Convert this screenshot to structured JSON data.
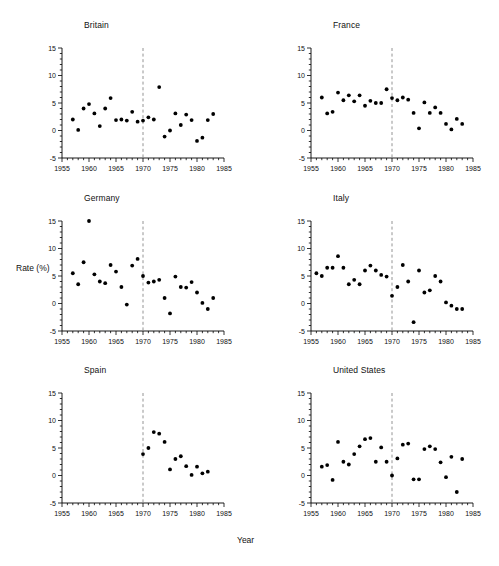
{
  "figure": {
    "xlabel": "Year",
    "ylabel": "Rate (%)"
  },
  "chart_data": [
    {
      "type": "scatter",
      "title": "Britain",
      "xlabel": "Year",
      "ylabel": "Rate (%)",
      "xlim": [
        1955,
        1985
      ],
      "ylim": [
        -5,
        15
      ],
      "xticks": [
        1955,
        1960,
        1965,
        1970,
        1975,
        1980,
        1985
      ],
      "yticks": [
        -5,
        0,
        5,
        10,
        15
      ],
      "grid": false,
      "reference_line_x": 1970,
      "reference_line_style": "dashed",
      "x": [
        1957,
        1958,
        1959,
        1960,
        1961,
        1962,
        1963,
        1964,
        1965,
        1966,
        1967,
        1968,
        1969,
        1970,
        1971,
        1972,
        1973,
        1974,
        1975,
        1976,
        1977,
        1978,
        1979,
        1980,
        1981,
        1982,
        1983
      ],
      "y": [
        2.0,
        0.1,
        4.0,
        4.8,
        3.1,
        0.8,
        4.0,
        5.9,
        1.9,
        2.0,
        1.8,
        3.4,
        1.6,
        1.8,
        2.4,
        2.0,
        7.9,
        -1.1,
        0.0,
        3.1,
        1.0,
        2.9,
        1.9,
        -1.9,
        -1.3,
        1.9,
        3.0
      ]
    },
    {
      "type": "scatter",
      "title": "France",
      "xlabel": "Year",
      "ylabel": "Rate (%)",
      "xlim": [
        1955,
        1985
      ],
      "ylim": [
        -5,
        15
      ],
      "xticks": [
        1955,
        1960,
        1965,
        1970,
        1975,
        1980,
        1985
      ],
      "yticks": [
        -5,
        0,
        5,
        10,
        15
      ],
      "grid": false,
      "reference_line_x": 1970,
      "reference_line_style": "dashed",
      "x": [
        1957,
        1958,
        1959,
        1960,
        1961,
        1962,
        1963,
        1964,
        1965,
        1966,
        1967,
        1968,
        1969,
        1970,
        1971,
        1972,
        1973,
        1974,
        1975,
        1976,
        1977,
        1978,
        1979,
        1980,
        1981,
        1982,
        1983
      ],
      "y": [
        6.0,
        3.1,
        3.4,
        6.9,
        5.5,
        6.4,
        5.3,
        6.4,
        4.5,
        5.4,
        5.0,
        5.0,
        7.5,
        5.9,
        5.5,
        6.0,
        5.6,
        3.2,
        0.4,
        5.1,
        3.2,
        4.2,
        3.2,
        1.2,
        0.2,
        2.1,
        1.2
      ]
    },
    {
      "type": "scatter",
      "title": "Germany",
      "xlabel": "Year",
      "ylabel": "Rate (%)",
      "xlim": [
        1955,
        1985
      ],
      "ylim": [
        -5,
        15
      ],
      "xticks": [
        1955,
        1960,
        1965,
        1970,
        1975,
        1980,
        1985
      ],
      "yticks": [
        -5,
        0,
        5,
        10,
        15
      ],
      "grid": false,
      "reference_line_x": 1970,
      "reference_line_style": "dashed",
      "x": [
        1957,
        1958,
        1959,
        1960,
        1961,
        1962,
        1963,
        1964,
        1965,
        1966,
        1967,
        1968,
        1969,
        1970,
        1971,
        1972,
        1973,
        1974,
        1975,
        1976,
        1977,
        1978,
        1979,
        1980,
        1981,
        1982,
        1983
      ],
      "y": [
        5.5,
        3.5,
        7.5,
        15.0,
        5.3,
        4.0,
        3.7,
        7.0,
        5.8,
        3.0,
        -0.2,
        6.9,
        8.1,
        5.0,
        3.8,
        4.0,
        4.3,
        1.0,
        -1.8,
        4.9,
        3.0,
        2.9,
        3.9,
        2.0,
        0.1,
        -1.0,
        1.0
      ]
    },
    {
      "type": "scatter",
      "title": "Italy",
      "xlabel": "Year",
      "ylabel": "Rate (%)",
      "xlim": [
        1955,
        1985
      ],
      "ylim": [
        -5,
        15
      ],
      "xticks": [
        1955,
        1960,
        1965,
        1970,
        1975,
        1980,
        1985
      ],
      "yticks": [
        -5,
        0,
        5,
        10,
        15
      ],
      "grid": false,
      "reference_line_x": 1970,
      "reference_line_style": "dashed",
      "x": [
        1956,
        1957,
        1958,
        1959,
        1960,
        1961,
        1962,
        1963,
        1964,
        1965,
        1966,
        1967,
        1968,
        1969,
        1970,
        1971,
        1972,
        1973,
        1974,
        1975,
        1976,
        1977,
        1978,
        1979,
        1980,
        1981,
        1982,
        1983
      ],
      "y": [
        5.5,
        5.0,
        6.5,
        6.5,
        8.6,
        6.5,
        3.5,
        4.3,
        3.5,
        6.0,
        6.9,
        6.0,
        5.2,
        4.9,
        1.4,
        3.0,
        7.0,
        4.0,
        -3.4,
        6.0,
        2.0,
        2.4,
        5.0,
        4.0,
        0.2,
        -0.4,
        -1.0,
        -1.0
      ]
    },
    {
      "type": "scatter",
      "title": "Spain",
      "xlabel": "Year",
      "ylabel": "Rate (%)",
      "xlim": [
        1955,
        1985
      ],
      "ylim": [
        -5,
        15
      ],
      "xticks": [
        1955,
        1960,
        1965,
        1970,
        1975,
        1980,
        1985
      ],
      "yticks": [
        -5,
        0,
        5,
        10,
        15
      ],
      "grid": false,
      "reference_line_x": 1970,
      "reference_line_style": "dashed",
      "x": [
        1970,
        1971,
        1972,
        1973,
        1974,
        1975,
        1976,
        1977,
        1978,
        1979,
        1980,
        1981,
        1982
      ],
      "y": [
        3.9,
        5.0,
        7.9,
        7.6,
        6.1,
        1.1,
        3.0,
        3.5,
        1.7,
        0.1,
        1.6,
        0.4,
        0.7
      ]
    },
    {
      "type": "scatter",
      "title": "United States",
      "xlabel": "Year",
      "ylabel": "Rate (%)",
      "xlim": [
        1955,
        1985
      ],
      "ylim": [
        -5,
        15
      ],
      "xticks": [
        1955,
        1960,
        1965,
        1970,
        1975,
        1980,
        1985
      ],
      "yticks": [
        -5,
        0,
        5,
        10,
        15
      ],
      "grid": false,
      "reference_line_x": 1970,
      "reference_line_style": "dashed",
      "x": [
        1957,
        1958,
        1959,
        1960,
        1961,
        1962,
        1963,
        1964,
        1965,
        1966,
        1967,
        1968,
        1969,
        1970,
        1971,
        1972,
        1973,
        1974,
        1975,
        1976,
        1977,
        1978,
        1979,
        1980,
        1981,
        1982,
        1983
      ],
      "y": [
        1.6,
        1.9,
        -0.8,
        6.1,
        2.5,
        2.0,
        3.9,
        5.3,
        6.6,
        6.8,
        2.5,
        5.1,
        2.5,
        0.0,
        3.1,
        5.6,
        5.8,
        -0.7,
        -0.7,
        4.8,
        5.3,
        4.8,
        2.4,
        -0.3,
        3.4,
        -3.0,
        3.0
      ]
    }
  ]
}
